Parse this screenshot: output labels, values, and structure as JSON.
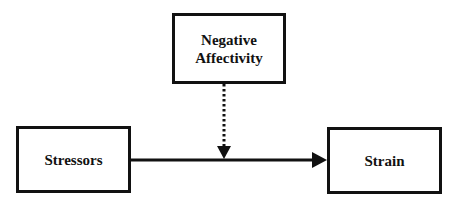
{
  "diagram": {
    "nodes": [
      {
        "id": "negative-affectivity",
        "label_line1": "Negative",
        "label_line2": "Affectivity"
      },
      {
        "id": "stressors",
        "label": "Stressors"
      },
      {
        "id": "strain",
        "label": "Strain"
      }
    ],
    "edges": [
      {
        "from": "stressors",
        "to": "strain",
        "style": "solid",
        "arrow": "end"
      },
      {
        "from": "negative-affectivity",
        "to": "stressors-strain-path",
        "style": "dotted",
        "arrow": "end",
        "meaning": "moderator"
      }
    ],
    "colors": {
      "stroke": "#111111",
      "background": "#ffffff"
    }
  }
}
